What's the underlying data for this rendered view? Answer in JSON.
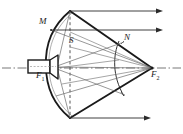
{
  "figure": {
    "kind": "optical-ray-diagram",
    "title": "",
    "background_color": "#ffffff",
    "stroke_color": "#1a1a1a",
    "thin_stroke_color": "#555555",
    "width": 183,
    "height": 134,
    "labels": [
      {
        "id": "M",
        "text": "M",
        "x": 39,
        "y": 21
      },
      {
        "id": "S",
        "text": "S",
        "x": 69,
        "y": 40
      },
      {
        "id": "N",
        "text": "N",
        "x": 124,
        "y": 37
      },
      {
        "id": "F1",
        "text": "F",
        "sub": "1",
        "x": 36,
        "y": 75
      },
      {
        "id": "F2",
        "text": "F",
        "sub": "2",
        "x": 151,
        "y": 73
      }
    ],
    "geometry": {
      "axis_y": 68,
      "main_reflector": {
        "name": "parabolic-dish",
        "top": [
          70,
          11
        ],
        "vertex": [
          46,
          66
        ],
        "bottom": [
          70,
          118
        ]
      },
      "sub_reflector": {
        "name": "hyperbolic-subreflector",
        "top": [
          119,
          41
        ],
        "bottom": [
          124,
          96
        ]
      },
      "focus_1": [
        57,
        67
      ],
      "focus_2": [
        152,
        68
      ],
      "feed_horn": {
        "x": 28,
        "y": 60,
        "w": 22,
        "h": 13
      },
      "dashed_axis_x": 70,
      "rays_out": [
        {
          "y": 11,
          "x0": 70,
          "x1": 163
        },
        {
          "y": 30,
          "x0": 56,
          "x1": 163
        },
        {
          "y": 118,
          "x0": 70,
          "x1": 151
        }
      ]
    }
  }
}
